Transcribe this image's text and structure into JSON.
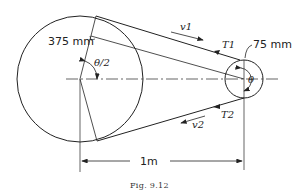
{
  "figure": {
    "caption": "Fig. 9.12",
    "large_pulley_radius_label": "375 mm",
    "small_pulley_radius_label": "75 mm",
    "center_distance_label": "1m",
    "half_angle_label": "θ/2",
    "angle_label": "θ",
    "tight_side_tension_label": "T1",
    "slack_side_tension_label": "T2",
    "tight_side_velocity_label": "v1",
    "slack_side_velocity_label": "v2"
  }
}
